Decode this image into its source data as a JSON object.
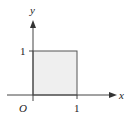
{
  "figure": {
    "axes": {
      "x_label": "x",
      "y_label": "y",
      "origin_label": "O",
      "x_tick_label": "1",
      "y_tick_label": "1"
    },
    "region": {
      "shape": "unit-square",
      "x_range": [
        0,
        1
      ],
      "y_range": [
        0,
        1
      ],
      "fill_color": "#efefef",
      "stroke_color": "#555555"
    },
    "colors": {
      "axis": "#444444",
      "text": "#222222"
    }
  }
}
